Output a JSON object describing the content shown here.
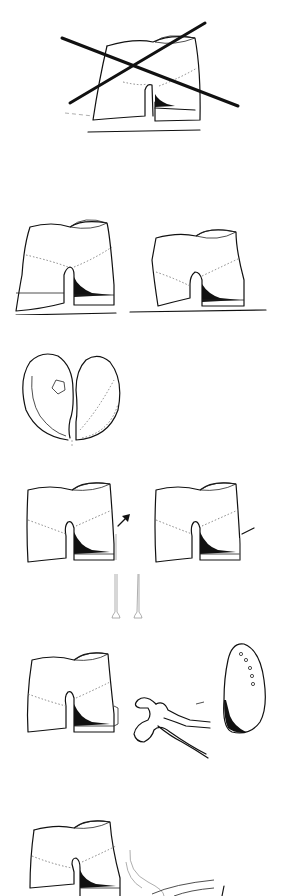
{
  "page": {
    "header_fragment": "",
    "background": "#ffffff",
    "ink_color": "#111111"
  },
  "figures": [
    {
      "id": "fig-1",
      "description": "Shoe last crossed out (incorrect)",
      "crossed_out": true
    },
    {
      "id": "fig-2a",
      "description": "Shoe last on flat base, variant A"
    },
    {
      "id": "fig-2b",
      "description": "Shoe last on flat base, variant B"
    },
    {
      "id": "fig-3",
      "description": "Heel/bottom pattern pieces (two lobes)"
    },
    {
      "id": "fig-4a",
      "description": "Last with nail indicated by arrow"
    },
    {
      "id": "fig-4b",
      "description": "Last with nail inserted at heel"
    },
    {
      "id": "fig-4c",
      "description": "Two tacks / nails"
    },
    {
      "id": "fig-5a",
      "description": "Last with heel piece tacked"
    },
    {
      "id": "fig-5b",
      "description": "Pincers / nail puller"
    },
    {
      "id": "fig-5c",
      "description": "Insole piece with nail holes"
    },
    {
      "id": "fig-6",
      "description": "Last with shoe upper being pulled over"
    }
  ]
}
